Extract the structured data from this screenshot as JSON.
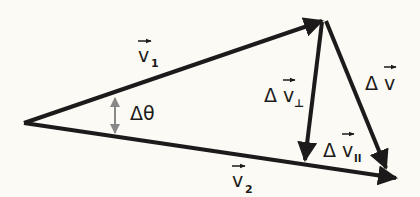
{
  "diagram": {
    "colors": {
      "background": "#fbfaf4",
      "ink": "#1c1a1a",
      "angle_marker": "#888888"
    },
    "vertices": {
      "origin": [
        24,
        123
      ],
      "v1_tip": [
        325,
        20
      ],
      "v2_tip": [
        398,
        178
      ],
      "perp_foot": [
        305,
        163
      ]
    },
    "vectors": [
      {
        "id": "v1",
        "label": "v",
        "subscript": "1",
        "from": "origin",
        "to": "v1_tip"
      },
      {
        "id": "v2",
        "label": "v",
        "subscript": "2",
        "from": "origin",
        "to": "v2_tip"
      },
      {
        "id": "dv_perp",
        "label": "Δv",
        "subscript": "⊥",
        "from": "v1_tip",
        "to": "perp_foot"
      },
      {
        "id": "dv",
        "label": "Δv",
        "subscript": "",
        "from": "v1_tip",
        "to": "v2_tip"
      },
      {
        "id": "dv_par",
        "label": "Δv",
        "subscript": "∥",
        "from": "perp_foot",
        "to": "v2_tip"
      }
    ],
    "angle": {
      "label": "Δθ"
    },
    "labels": {
      "v1": {
        "base": "v",
        "sub": "1"
      },
      "v2": {
        "base": "v",
        "sub": "2"
      },
      "dv_perp": {
        "delta": "Δ",
        "base": "v",
        "sub": "⊥"
      },
      "dv": {
        "delta": "Δ",
        "base": "v"
      },
      "dv_par": {
        "delta": "Δ",
        "base": "v",
        "sub": "II"
      },
      "dtheta": "Δθ"
    }
  }
}
